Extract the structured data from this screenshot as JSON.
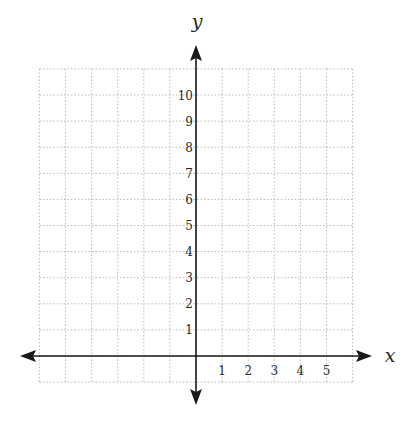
{
  "chart_data": {
    "type": "scatter",
    "title": "",
    "xlabel": "x",
    "ylabel": "y",
    "xlim": [
      -6,
      6
    ],
    "ylim": [
      -1,
      11
    ],
    "x_ticks": [
      1,
      2,
      3,
      4,
      5
    ],
    "y_ticks": [
      1,
      2,
      3,
      4,
      5,
      6,
      7,
      8,
      9,
      10
    ],
    "x_tick_labels": [
      "1",
      "2",
      "3",
      "4",
      "5"
    ],
    "y_tick_labels": [
      "1",
      "2",
      "3",
      "4",
      "5",
      "6",
      "7",
      "8",
      "9",
      "10"
    ],
    "grid": true,
    "grid_style": "dotted",
    "series": [],
    "legend": null
  },
  "colors": {
    "axis": "#1a1a1a",
    "grid": "#b8b8b8",
    "text": "#2a2a2a",
    "background": "#ffffff"
  },
  "layout": {
    "origin_px": [
      196,
      356
    ],
    "unit_px": 26.1,
    "grid_x_range": [
      -6,
      6
    ],
    "grid_y_range": [
      -1,
      11
    ]
  }
}
